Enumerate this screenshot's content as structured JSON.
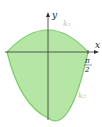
{
  "diagram": {
    "axes": {
      "x_label": "x",
      "y_label": "y"
    },
    "tick": {
      "numerator": "π",
      "denominator": "2"
    },
    "curves": [
      {
        "name": "k₁",
        "position": "upper"
      },
      {
        "name": "k₂",
        "position": "lower"
      }
    ],
    "colors": {
      "fill": "#b6e6a6",
      "stroke": "#7ccc6a",
      "axis": "#333333",
      "curve_label": "#b9c9b0"
    }
  }
}
